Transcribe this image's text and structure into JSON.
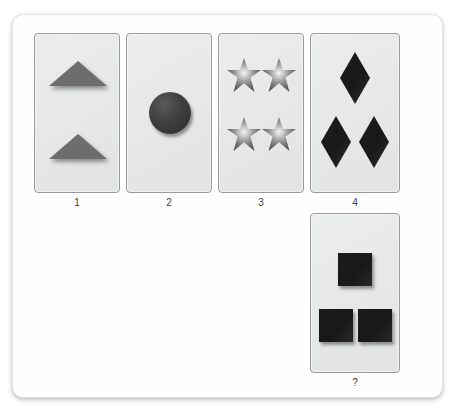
{
  "top_sliver_text": "",
  "puzzle": {
    "type": "visual-pattern-sequence",
    "options": [
      {
        "id": "card-1",
        "label": "1",
        "shape": "triangle",
        "count": 2,
        "arrangement": "vertical-pair",
        "color": "#6d6d6d"
      },
      {
        "id": "card-2",
        "label": "2",
        "shape": "circle",
        "count": 1,
        "arrangement": "single-center",
        "color": "#3f3f3f"
      },
      {
        "id": "card-3",
        "label": "3",
        "shape": "star",
        "count": 4,
        "arrangement": "2x2-grid",
        "color": "#6a6a6a"
      },
      {
        "id": "card-4",
        "label": "4",
        "shape": "diamond",
        "count": 3,
        "arrangement": "one-top-two-bottom",
        "color": "#1d1d1d"
      }
    ],
    "question_card": {
      "id": "card-q",
      "label": "?",
      "shape": "square",
      "count": 3,
      "arrangement": "one-top-two-bottom",
      "color": "#1b1b1b"
    }
  }
}
